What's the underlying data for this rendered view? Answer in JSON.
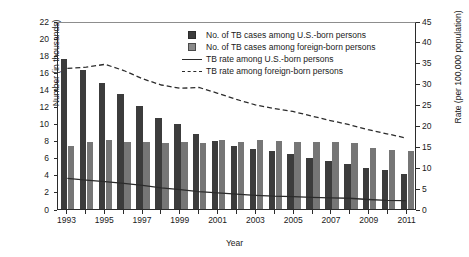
{
  "chart_data": {
    "type": "bar",
    "title": "",
    "xlabel": "Year",
    "ylabel": "Number (in thousands)",
    "ylabel_right": "Rate (per 100,000 population)",
    "grid": false,
    "legend_position": "top-center",
    "categories": [
      1993,
      1994,
      1995,
      1996,
      1997,
      1998,
      1999,
      2000,
      2001,
      2002,
      2003,
      2004,
      2005,
      2006,
      2007,
      2008,
      2009,
      2010,
      2011
    ],
    "xtick_labels": [
      "1993",
      "1995",
      "1997",
      "1999",
      "2001",
      "2003",
      "2005",
      "2007",
      "2009",
      "2011"
    ],
    "ylim": [
      0,
      22
    ],
    "yticks": [
      0,
      2,
      4,
      6,
      8,
      10,
      12,
      14,
      16,
      18,
      20,
      22
    ],
    "ylim_right": [
      0,
      45
    ],
    "yticks_right": [
      0,
      5,
      10,
      15,
      20,
      25,
      30,
      35,
      40,
      45
    ],
    "series": [
      {
        "name": "No. of TB cases among U.S.-born persons",
        "type": "bar",
        "axis": "left",
        "color": "#3c3c3c",
        "values": [
          17.5,
          16.3,
          14.8,
          13.5,
          12.1,
          10.7,
          9.9,
          8.8,
          8.0,
          7.4,
          7.0,
          6.8,
          6.4,
          6.0,
          5.6,
          5.3,
          4.8,
          4.6,
          4.1
        ]
      },
      {
        "name": "No. of TB cases among foreign-born persons",
        "type": "bar",
        "axis": "left",
        "color": "#767676",
        "values": [
          7.4,
          7.8,
          8.1,
          7.8,
          7.9,
          7.7,
          7.8,
          7.7,
          8.1,
          7.8,
          8.1,
          8.0,
          7.8,
          7.9,
          7.8,
          7.7,
          7.1,
          6.9,
          6.8
        ]
      },
      {
        "name": "TB rate among U.S.-born persons",
        "type": "line",
        "style": "solid",
        "axis": "right",
        "color": "#2b2b2b",
        "values": [
          7.4,
          7.0,
          6.6,
          6.2,
          5.7,
          5.1,
          4.7,
          4.2,
          3.9,
          3.6,
          3.3,
          3.1,
          3.0,
          2.8,
          2.7,
          2.6,
          2.3,
          2.1,
          2.0
        ]
      },
      {
        "name": "TB rate among foreign-born persons",
        "type": "line",
        "style": "dashed",
        "axis": "right",
        "color": "#2b2b2b",
        "values": [
          34.0,
          34.3,
          35.0,
          33.5,
          31.5,
          30.0,
          29.2,
          29.4,
          28.0,
          26.5,
          25.2,
          24.3,
          23.6,
          22.5,
          21.4,
          20.4,
          19.2,
          18.2,
          17.2
        ]
      }
    ],
    "legend": [
      {
        "label": "No. of TB cases among U.S.-born persons",
        "marker": "square-dark"
      },
      {
        "label": "No. of TB cases among foreign-born persons",
        "marker": "square-gray"
      },
      {
        "label": "TB rate among U.S.-born persons",
        "marker": "line-solid"
      },
      {
        "label": "TB rate among foreign-born persons",
        "marker": "line-dashed"
      }
    ]
  }
}
